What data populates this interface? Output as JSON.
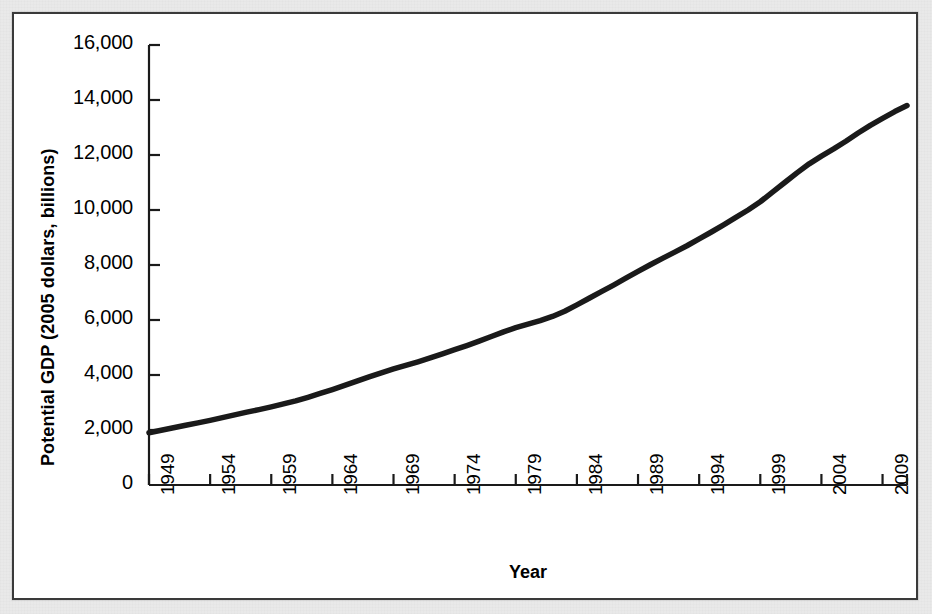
{
  "chart_data": {
    "type": "line",
    "title": "",
    "xlabel": "Year",
    "ylabel": "Potential GDP (2005 dollars, billions)",
    "xlim": [
      1949,
      2011
    ],
    "ylim": [
      0,
      16000
    ],
    "grid": false,
    "legend": null,
    "line_color": "#1a1a1a",
    "x_tick_labels": [
      "1949",
      "1954",
      "1959",
      "1964",
      "1969",
      "1974",
      "1979",
      "1984",
      "1989",
      "1994",
      "1999",
      "2004",
      "2009"
    ],
    "y_tick_labels": [
      "0",
      "2,000",
      "4,000",
      "6,000",
      "8,000",
      "10,000",
      "12,000",
      "14,000",
      "16,000"
    ],
    "y_tick_values": [
      0,
      2000,
      4000,
      6000,
      8000,
      10000,
      12000,
      14000,
      16000
    ],
    "x": [
      1949,
      1950,
      1951,
      1952,
      1953,
      1954,
      1955,
      1956,
      1957,
      1958,
      1959,
      1960,
      1961,
      1962,
      1963,
      1964,
      1965,
      1966,
      1967,
      1968,
      1969,
      1970,
      1971,
      1972,
      1973,
      1974,
      1975,
      1976,
      1977,
      1978,
      1979,
      1980,
      1981,
      1982,
      1983,
      1984,
      1985,
      1986,
      1987,
      1988,
      1989,
      1990,
      1991,
      1992,
      1993,
      1994,
      1995,
      1996,
      1997,
      1998,
      1999,
      2000,
      2001,
      2002,
      2003,
      2004,
      2005,
      2006,
      2007,
      2008,
      2009,
      2010,
      2011
    ],
    "values": [
      1900,
      1990,
      2080,
      2170,
      2260,
      2350,
      2450,
      2550,
      2650,
      2740,
      2840,
      2950,
      3060,
      3190,
      3330,
      3470,
      3620,
      3780,
      3930,
      4080,
      4220,
      4350,
      4480,
      4620,
      4770,
      4920,
      5070,
      5230,
      5400,
      5570,
      5720,
      5850,
      5980,
      6130,
      6320,
      6550,
      6790,
      7030,
      7270,
      7520,
      7770,
      8010,
      8240,
      8470,
      8700,
      8950,
      9200,
      9460,
      9730,
      10000,
      10300,
      10650,
      11000,
      11350,
      11680,
      11960,
      12220,
      12500,
      12800,
      13080,
      13330,
      13580,
      13800
    ]
  },
  "axis": {
    "x_label": "Year",
    "y_label": "Potential GDP (2005 dollars, billions)"
  }
}
